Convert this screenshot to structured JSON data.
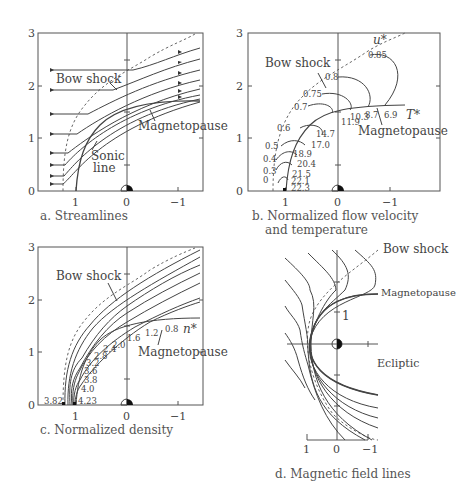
{
  "figure": {
    "panels": [
      {
        "id": "a",
        "caption": "a. Streamlines",
        "labels": {
          "bow_shock": "Bow shock",
          "magnetopause": "Magnetopause",
          "sonic_line_1": "Sonic",
          "sonic_line_2": "line"
        },
        "x_ticks": [
          "1",
          "0",
          "−1"
        ],
        "y_ticks": [
          "0",
          "1",
          "2",
          "3"
        ]
      },
      {
        "id": "b",
        "caption_line1": "b. Normalized flow velocity",
        "caption_line2": "and temperature",
        "labels": {
          "bow_shock": "Bow shock",
          "magnetopause": "Magnetopause",
          "u": "u*",
          "T": "T*"
        },
        "u_contours": [
          "0",
          "0.3",
          "0.4",
          "0.5",
          "0.6",
          "0.7",
          "0.75",
          "0.8",
          "0.85"
        ],
        "T_contours": [
          "22.3",
          "22.1",
          "21.5",
          "20.4",
          "18.9",
          "17.0",
          "14.7",
          "11.9",
          "10.3",
          "8.7",
          "6.9"
        ],
        "x_ticks": [
          "1",
          "0",
          "−1"
        ],
        "y_ticks": [
          "0",
          "1",
          "2",
          "3"
        ]
      },
      {
        "id": "c",
        "caption": "c. Normalized density",
        "labels": {
          "bow_shock": "Bow shock",
          "magnetopause": "Magnetopause",
          "n": "n*"
        },
        "n_contours": [
          "3.82",
          "4.23",
          "4.0",
          "3.8",
          "3.6",
          "3.2",
          "2.8",
          "2.4",
          "2.0",
          "1.6",
          "1.2",
          "0.8"
        ],
        "x_ticks": [
          "1",
          "0",
          "−1"
        ],
        "y_ticks": [
          "0",
          "1",
          "2",
          "3"
        ]
      },
      {
        "id": "d",
        "caption": "d. Magnetic field lines",
        "labels": {
          "bow_shock": "Bow shock",
          "magnetopause": "Magnetopause",
          "ecliptic": "Ecliptic",
          "one": "1"
        },
        "x_ticks": [
          "1",
          "0",
          "−1"
        ]
      }
    ]
  }
}
